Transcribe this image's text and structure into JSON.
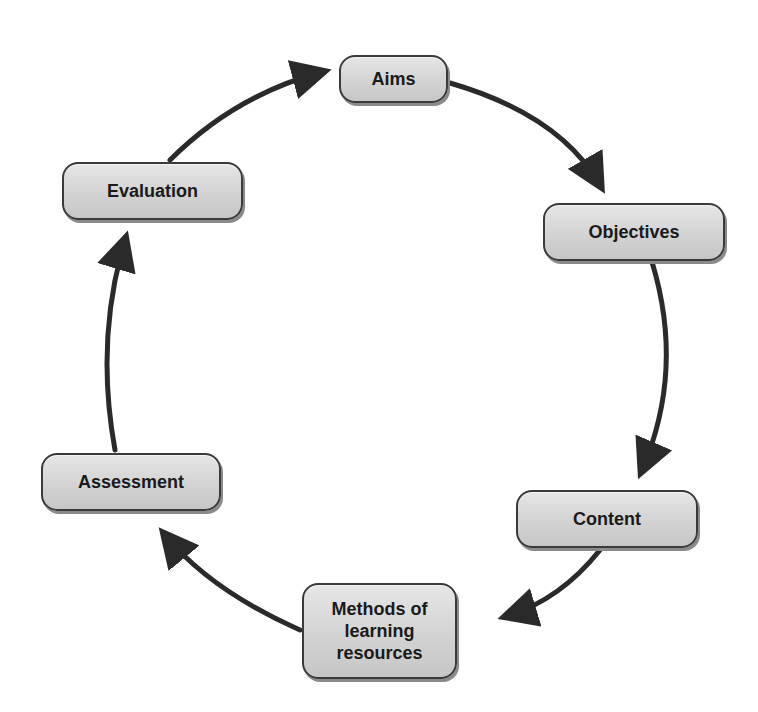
{
  "diagram": {
    "type": "cycle",
    "nodes": [
      {
        "id": "aims",
        "label": "Aims"
      },
      {
        "id": "objectives",
        "label": "Objectives"
      },
      {
        "id": "content",
        "label": "Content"
      },
      {
        "id": "methods",
        "label": "Methods of\nlearning\nresources"
      },
      {
        "id": "assessment",
        "label": "Assessment"
      },
      {
        "id": "evaluation",
        "label": "Evaluation"
      }
    ],
    "edges": [
      {
        "from": "aims",
        "to": "objectives"
      },
      {
        "from": "objectives",
        "to": "content"
      },
      {
        "from": "content",
        "to": "methods"
      },
      {
        "from": "methods",
        "to": "assessment"
      },
      {
        "from": "assessment",
        "to": "evaluation"
      },
      {
        "from": "evaluation",
        "to": "aims"
      }
    ],
    "colors": {
      "node_fill": "#d3d3d3",
      "node_border": "#3a3a3a",
      "arrow": "#2a2a2a",
      "text": "#1a1a1a"
    }
  }
}
